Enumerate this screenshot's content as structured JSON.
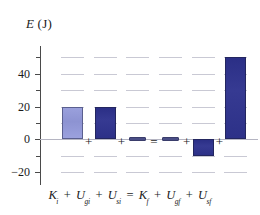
{
  "chart_data": {
    "type": "bar",
    "title": "",
    "ylabel": "E (J)",
    "xlabel": "",
    "categories": [
      "K_i",
      "U_gi",
      "U_si",
      "K_f",
      "U_gf",
      "U_sf"
    ],
    "category_labels": [
      {
        "symbol": "K",
        "sub": "i"
      },
      {
        "symbol": "U",
        "sub": "gi"
      },
      {
        "symbol": "U",
        "sub": "si"
      },
      {
        "symbol": "K",
        "sub": "f"
      },
      {
        "symbol": "U",
        "sub": "gf"
      },
      {
        "symbol": "U",
        "sub": "sf"
      }
    ],
    "values": [
      20,
      20,
      0,
      0,
      -10,
      50
    ],
    "bar_styles": [
      "light",
      "dark",
      "zero",
      "zero",
      "dark",
      "dark"
    ],
    "operators": [
      "+",
      "+",
      "=",
      "+",
      "+"
    ],
    "ylim": [
      -28,
      57
    ],
    "yticks": [
      -20,
      0,
      20,
      40
    ],
    "ytick_labels": [
      "−20",
      "0",
      "20",
      "40"
    ],
    "yminor": [
      -10,
      10,
      30,
      50
    ],
    "grid": true,
    "grid_style": "dashed",
    "legend": "none",
    "colors": {
      "bar_light": "#8d93d2",
      "bar_dark": "#2d3188",
      "axis": "#4a4a4a",
      "grid": "#c9c9d4",
      "text": "#1a1a1a"
    }
  },
  "equation": {
    "lhs": [
      {
        "symbol": "K",
        "sub": "i"
      },
      {
        "symbol": "U",
        "sub": "gi"
      },
      {
        "symbol": "U",
        "sub": "si"
      }
    ],
    "rhs": [
      {
        "symbol": "K",
        "sub": "f"
      },
      {
        "symbol": "U",
        "sub": "gf"
      },
      {
        "symbol": "U",
        "sub": "sf"
      }
    ],
    "plus": "+",
    "equals": "="
  },
  "axis": {
    "label_symbol": "E",
    "label_unit": "(J)"
  }
}
